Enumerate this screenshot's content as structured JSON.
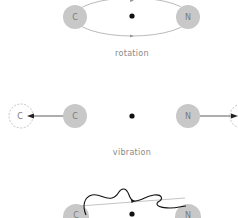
{
  "diagram": {
    "panels": [
      {
        "id": "rotation",
        "caption": "rotation",
        "atoms": [
          {
            "symbol": "C"
          },
          {
            "symbol": "N"
          }
        ]
      },
      {
        "id": "vibration",
        "caption": "vibration",
        "atoms": [
          {
            "symbol": "C"
          },
          {
            "symbol": "N"
          }
        ],
        "displaced_atoms": [
          {
            "symbol": "C"
          },
          {
            "symbol": ""
          }
        ]
      },
      {
        "id": "bending",
        "caption": "",
        "atoms": [
          {
            "symbol": "C"
          },
          {
            "symbol": "N"
          }
        ]
      }
    ],
    "colors": {
      "atom_fill": "#c8c8c8",
      "atom_text": "#7a7a7a",
      "orbit_line": "#a0a0a0",
      "center_dot": "#111111",
      "arrow": "#222222",
      "wave": "#111111",
      "caption": "#888888"
    }
  }
}
